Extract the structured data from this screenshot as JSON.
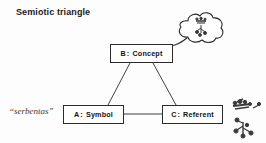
{
  "diagram": {
    "title": "Semiotic triangle",
    "background_color": "#fdfdfd",
    "line_color": "#2b2b2b",
    "text_color": "#111111",
    "annotation": {
      "word": "“serbentas”",
      "style": "italic"
    },
    "nodes": [
      {
        "id": "concept",
        "key": "B",
        "separator": ":",
        "name": "Concept",
        "full_label": "B : Concept"
      },
      {
        "id": "symbol",
        "key": "A",
        "separator": ":",
        "name": "Symbol",
        "full_label": "A : Symbol"
      },
      {
        "id": "referent",
        "key": "C",
        "separator": ":",
        "name": "Referent",
        "full_label": "C : Referent"
      }
    ],
    "edges": [
      {
        "from": "concept",
        "to": "symbol",
        "style": "solid"
      },
      {
        "from": "concept",
        "to": "referent",
        "style": "solid"
      },
      {
        "from": "symbol",
        "to": "referent",
        "style": "solid"
      }
    ],
    "illustrations": [
      {
        "id": "thought-cloud",
        "depicts": "thought-bubble-with-berry-branch-sketch",
        "attached_to": "concept"
      },
      {
        "id": "plant-sketch",
        "depicts": "berry-branch-sketch",
        "attached_to": "referent"
      }
    ]
  }
}
